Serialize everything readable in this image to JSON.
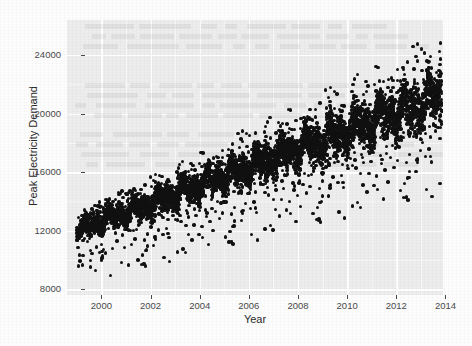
{
  "chart_data": {
    "type": "scatter",
    "title": "",
    "xlabel": "Year",
    "ylabel": "Peak Electricity Demand",
    "xlim": [
      1998.6,
      2013.9
    ],
    "ylim": [
      7600,
      26400
    ],
    "xticks": [
      2000,
      2002,
      2004,
      2006,
      2008,
      2010,
      2012,
      2014
    ],
    "xtick_labels": [
      "2000",
      "2002",
      "2004",
      "2006",
      "2008",
      "2010",
      "2012",
      "2014"
    ],
    "yticks": [
      8000,
      12000,
      16000,
      20000,
      24000
    ],
    "ytick_labels": [
      "8000",
      "12000",
      "16000",
      "20000",
      "24000"
    ],
    "grid": true,
    "grid_color": "#ffffff",
    "panel_background": "#ededed",
    "point_color": "#111111",
    "point_size": 3.4,
    "legend": null,
    "series": [
      {
        "name": "Peak Electricity Demand",
        "marker": "filled-circle",
        "trend": {
          "description": "upper envelope and cloud centre rise roughly linearly",
          "baseline_1999": 11900,
          "baseline_2013": 20900,
          "upper_envelope_1999": 13200,
          "upper_envelope_2013": 25700,
          "lower_outlier_floor_1999": 8100,
          "lower_outlier_floor_2013": 14200
        },
        "seasonal": {
          "description": "annual cycle; summer/winter peaks push well above the cloud centre",
          "amplitude_1999": 900,
          "amplitude_2013": 2600,
          "peaks_per_year": 2
        },
        "annual_summary": [
          {
            "year": 1999,
            "min": 8100,
            "median": 11900,
            "max": 13300
          },
          {
            "year": 2000,
            "min": 8600,
            "median": 12300,
            "max": 14000
          },
          {
            "year": 2001,
            "min": 9200,
            "median": 12800,
            "max": 15100
          },
          {
            "year": 2002,
            "min": 9900,
            "median": 13400,
            "max": 16200
          },
          {
            "year": 2003,
            "min": 10400,
            "median": 14000,
            "max": 17000
          },
          {
            "year": 2004,
            "min": 10900,
            "median": 14800,
            "max": 18100
          },
          {
            "year": 2005,
            "min": 11300,
            "median": 15600,
            "max": 19200
          },
          {
            "year": 2006,
            "min": 11700,
            "median": 16400,
            "max": 20400
          },
          {
            "year": 2007,
            "min": 12100,
            "median": 17100,
            "max": 21300
          },
          {
            "year": 2008,
            "min": 12400,
            "median": 17700,
            "max": 22000
          },
          {
            "year": 2009,
            "min": 12800,
            "median": 18300,
            "max": 22800
          },
          {
            "year": 2010,
            "min": 13100,
            "median": 18900,
            "max": 23600
          },
          {
            "year": 2011,
            "min": 13500,
            "median": 19500,
            "max": 24300
          },
          {
            "year": 2012,
            "min": 13900,
            "median": 20200,
            "max": 25200
          },
          {
            "year": 2013,
            "min": 14200,
            "median": 20800,
            "max": 25800
          }
        ],
        "approx_point_count": 5400
      }
    ]
  }
}
